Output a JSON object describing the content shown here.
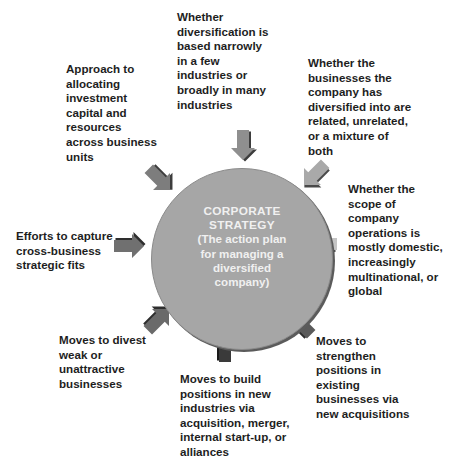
{
  "center": {
    "title_line1": "CORPORATE",
    "title_line2": "STRATEGY",
    "subtitle": "(The action plan\nfor managing a\ndiversified\ncompany)"
  },
  "labels": {
    "top": "Whether\ndiversification is\nbased narrowly\nin a few\nindustries or\nbroadly in many\nindustries",
    "top_right": "Whether the\nbusinesses the\ncompany has\ndiversified into are\nrelated, unrelated,\nor a mixture of\nboth",
    "right": "Whether the\nscope of\ncompany\noperations is\nmostly domestic,\nincreasingly\nmultinational, or\nglobal",
    "bottom_right": "Moves to\nstrengthen\npositions in\nexisting\nbusinesses via\nnew acquisitions",
    "bottom": "Moves to build\npositions in new\nindustries via\nacquisition, merger,\ninternal start-up, or\nalliances",
    "bottom_left": "Moves to divest\nweak or\nunattractive\nbusinesses",
    "left": "Efforts to capture\ncross-business\nstrategic fits",
    "top_left": "Approach to\nallocating\ninvestment\ncapital and\nresources\nacross business\nunits"
  },
  "colors": {
    "circle": "#a6a6a6",
    "arrow_light": "#b8b8b8",
    "arrow_mid": "#8c8c8c",
    "arrow_dark": "#5a5a5a",
    "arrow_darkest": "#3a3a3a"
  }
}
